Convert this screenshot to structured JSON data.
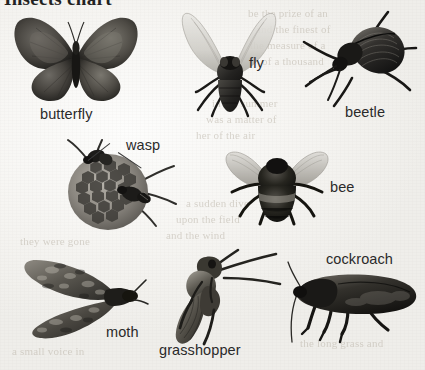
{
  "figure": {
    "heading": "Insects chart",
    "background_note": "scanned book page with faint bleed-through text"
  },
  "ghost_text": {
    "lines_right": [
      "be the prize of an",
      "and the finest of",
      "the measure of a",
      "of a thousand",
      "in the summer",
      "was a matter of",
      "her of the air",
      "a sudden dive",
      "upon the field",
      "and the wind"
    ],
    "lines_bottom": [
      "a small voice in",
      "the long grass and",
      "they were gone"
    ]
  },
  "specimens": [
    {
      "id": "butterfly",
      "label": "butterfly",
      "label_x": 40,
      "label_y": 106,
      "has_leader": false
    },
    {
      "id": "fly",
      "label": "fly",
      "label_x": 249,
      "label_y": 55,
      "has_leader": false
    },
    {
      "id": "beetle",
      "label": "beetle",
      "label_x": 345,
      "label_y": 104,
      "has_leader": false
    },
    {
      "id": "wasp",
      "label": "wasp",
      "label_x": 126,
      "label_y": 137,
      "has_leader": true
    },
    {
      "id": "bee",
      "label": "bee",
      "label_x": 330,
      "label_y": 179,
      "has_leader": false
    },
    {
      "id": "cockroach",
      "label": "cockroach",
      "label_x": 326,
      "label_y": 251,
      "has_leader": false
    },
    {
      "id": "moth",
      "label": "moth",
      "label_x": 106,
      "label_y": 324,
      "has_leader": false
    },
    {
      "id": "grasshopper",
      "label": "grasshopper",
      "label_x": 159,
      "label_y": 342,
      "has_leader": false
    }
  ],
  "colors": {
    "paper": "#f6f5f2",
    "ink": "#2a2a2a",
    "ghost": "#b9b2a6",
    "specimen_dark": "#1d1c1a",
    "specimen_mid": "#5d5a55",
    "specimen_light": "#a8a49c"
  }
}
